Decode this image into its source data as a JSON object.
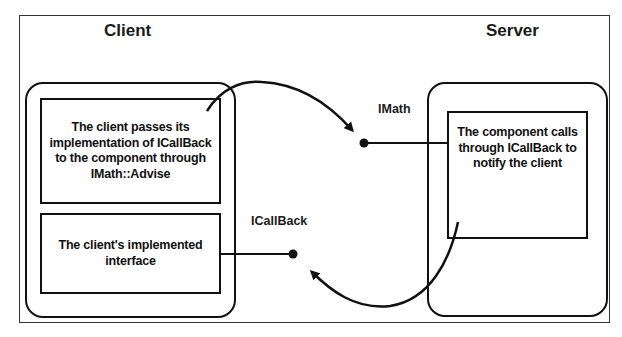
{
  "diagram": {
    "titles": {
      "client": "Client",
      "server": "Server"
    },
    "client": {
      "box_advise": "The client passes its implementation of ICallBack to the component through IMath::Advise",
      "box_interface": "The client's implemented interface"
    },
    "server": {
      "box_component": "The component calls through ICallBack to notify the client"
    },
    "interfaces": {
      "imath": "IMath",
      "icallback": "ICallBack"
    },
    "arrows": [
      {
        "from": "client-advise-box",
        "to": "imath-interface",
        "label": "Advise"
      },
      {
        "from": "server-component-box",
        "to": "icallback-interface",
        "label": "Callback"
      }
    ],
    "colors": {
      "stroke": "#111111",
      "background": "#ffffff"
    }
  }
}
